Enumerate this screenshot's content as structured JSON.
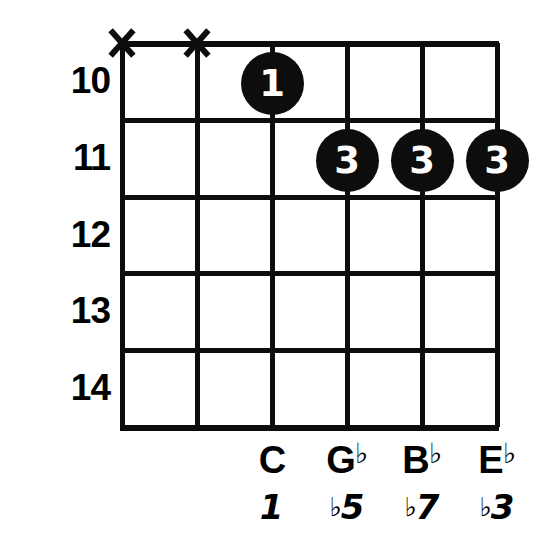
{
  "diagram": {
    "type": "guitar-chord-diagram",
    "fret_numbers": [
      "10",
      "11",
      "12",
      "13",
      "14"
    ],
    "string_count": 6,
    "fret_count": 5,
    "ink_color": "#0d0d0d",
    "background_color": "#ffffff",
    "dot_text_color": "#ffffff",
    "muted_strings": [
      {
        "string": 1,
        "marker": "X"
      },
      {
        "string": 2,
        "marker": "X"
      }
    ],
    "fingerings": [
      {
        "string": 3,
        "fret": "10",
        "finger": "1"
      },
      {
        "string": 4,
        "fret": "11",
        "finger": "3"
      },
      {
        "string": 5,
        "fret": "11",
        "finger": "3"
      },
      {
        "string": 6,
        "fret": "11",
        "finger": "3"
      }
    ],
    "notes": [
      {
        "string": 3,
        "letter": "C",
        "accidental": "",
        "interval_number": "1",
        "interval_accidental": ""
      },
      {
        "string": 4,
        "letter": "G",
        "accidental": "♭",
        "interval_number": "5",
        "interval_accidental": "♭"
      },
      {
        "string": 5,
        "letter": "B",
        "accidental": "♭",
        "interval_number": "7",
        "interval_accidental": "♭"
      },
      {
        "string": 6,
        "letter": "E",
        "accidental": "♭",
        "interval_number": "3",
        "interval_accidental": "♭"
      }
    ]
  }
}
